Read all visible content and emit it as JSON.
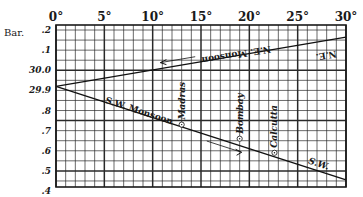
{
  "chart_data": {
    "type": "line",
    "title": "",
    "xlabel": "",
    "ylabel": "Bar.",
    "x_unit": "°",
    "xlim": [
      0,
      30
    ],
    "ylim": [
      29.42,
      30.225
    ],
    "x_ticks": [
      0,
      5,
      10,
      15,
      20,
      25,
      30
    ],
    "x_tick_labels": [
      "0°",
      "5°",
      "10°",
      "15°",
      "20°",
      "25°",
      "30°"
    ],
    "y_ticks": [
      30.2,
      30.1,
      30.0,
      29.9,
      29.8,
      29.7,
      29.6,
      29.5,
      29.4
    ],
    "y_tick_labels": [
      ".2",
      ".1",
      "30.0",
      "29.9",
      ".8",
      ".7",
      ".6",
      ".5",
      ".4"
    ],
    "grid": true,
    "grid_minor_x": 1,
    "grid_minor_y": 0.05,
    "grid_major_x": 5,
    "series": [
      {
        "name": "N.E. Monsoon",
        "end_label": "N.E.",
        "x": [
          0,
          30
        ],
        "y": [
          29.92,
          30.165
        ],
        "arrow": "points toward 0°"
      },
      {
        "name": "S.W. Monsoon",
        "end_label": "S.W.",
        "x": [
          0,
          30
        ],
        "y": [
          29.92,
          29.455
        ],
        "arrow": "points toward 30°"
      }
    ],
    "annotations": [
      {
        "text": "Madras",
        "x": 13.0,
        "y": 29.73,
        "marker": "circle-dot",
        "rotation": -90
      },
      {
        "text": "Bombay",
        "x": 19.0,
        "y": 29.66,
        "marker": "circle-dot",
        "rotation": -90
      },
      {
        "text": "Calcutta",
        "x": 22.6,
        "y": 29.59,
        "marker": "circle-dot",
        "rotation": -90
      }
    ],
    "legend": "none (labels placed along lines)"
  }
}
